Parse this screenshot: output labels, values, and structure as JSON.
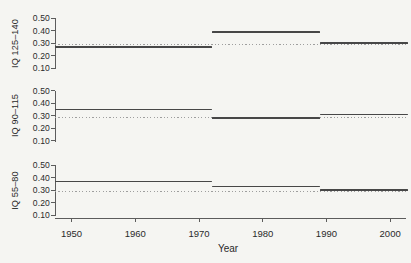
{
  "chart_data": {
    "type": "line",
    "title": "",
    "xlabel": "Year",
    "x_range": [
      1947.4,
      2002.8
    ],
    "x_ticks": [
      1950,
      1960,
      1970,
      1980,
      1990,
      2000
    ],
    "y_range": [
      0.1,
      0.5
    ],
    "y_ticks": [
      0.5,
      0.4,
      0.3,
      0.2,
      0.1
    ],
    "y_tick_labels": [
      "0.50",
      "0.40",
      "0.30",
      "0.20",
      "0.10"
    ],
    "grid": "off",
    "legend": "none",
    "reference_line": {
      "style": "dotted",
      "value": 0.3
    },
    "period_breaks": [
      1972,
      1989
    ],
    "segments_x": [
      [
        1947.4,
        1972
      ],
      [
        1972,
        1989
      ],
      [
        1989,
        2002.8
      ]
    ],
    "panels": [
      {
        "ylabel": "IQ 125–140",
        "segment_values": [
          0.27,
          0.39,
          0.3
        ]
      },
      {
        "ylabel": "IQ 90–115",
        "segment_values": [
          0.35,
          0.28,
          0.31
        ]
      },
      {
        "ylabel": "IQ 55–80",
        "segment_values": [
          0.37,
          0.33,
          0.3
        ]
      }
    ],
    "colors": {
      "line": "#474747",
      "dotted_reference": "#9e9e9e",
      "axis": "#5c5c5c",
      "background": "#f5f5f2"
    }
  }
}
